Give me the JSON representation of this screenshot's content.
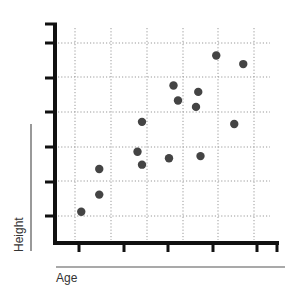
{
  "chart_data": {
    "type": "scatter",
    "title": "",
    "xlabel": "Age",
    "ylabel": "Height",
    "grid": true,
    "grid_style": "dotted",
    "legend": null,
    "x_tick_labels": [],
    "y_tick_labels": [],
    "xlim": [
      0,
      10
    ],
    "ylim": [
      0,
      10
    ],
    "point_color": "#444444",
    "points": [
      {
        "x": 0.5,
        "y": 0.9
      },
      {
        "x": 1.3,
        "y": 1.7
      },
      {
        "x": 1.3,
        "y": 2.9
      },
      {
        "x": 3.0,
        "y": 3.7
      },
      {
        "x": 3.2,
        "y": 5.1
      },
      {
        "x": 3.2,
        "y": 3.1
      },
      {
        "x": 4.4,
        "y": 3.4
      },
      {
        "x": 4.6,
        "y": 6.8
      },
      {
        "x": 4.8,
        "y": 6.1
      },
      {
        "x": 5.6,
        "y": 5.8
      },
      {
        "x": 5.7,
        "y": 6.5
      },
      {
        "x": 5.8,
        "y": 3.5
      },
      {
        "x": 6.5,
        "y": 8.2
      },
      {
        "x": 7.3,
        "y": 5.0
      },
      {
        "x": 7.7,
        "y": 7.8
      }
    ]
  },
  "labels": {
    "x": "Age",
    "y": "Height"
  }
}
